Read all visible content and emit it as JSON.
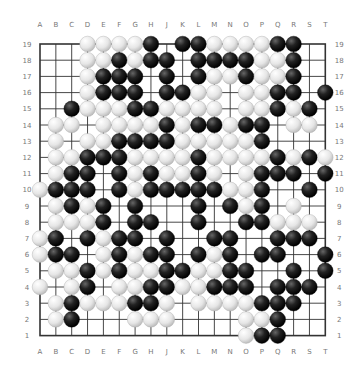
{
  "board": {
    "size": 19,
    "columns": [
      "A",
      "B",
      "C",
      "D",
      "E",
      "F",
      "G",
      "H",
      "J",
      "K",
      "L",
      "M",
      "N",
      "O",
      "P",
      "Q",
      "R",
      "S",
      "T"
    ],
    "rows": [
      "19",
      "18",
      "17",
      "16",
      "15",
      "14",
      "13",
      "12",
      "11",
      "10",
      "9",
      "8",
      "7",
      "6",
      "5",
      "4",
      "3",
      "2",
      "1"
    ],
    "colors": {
      "background": "#ffffff",
      "grid": "#333333",
      "black": "#1a1a1a",
      "white": "#f2f2f2",
      "label": "#777777"
    },
    "stones": {
      "19": {
        "D": "W",
        "E": "W",
        "F": "W",
        "G": "W",
        "H": "B",
        "K": "B",
        "L": "B",
        "M": "W",
        "N": "W",
        "O": "W",
        "P": "W",
        "Q": "B",
        "R": "B"
      },
      "18": {
        "D": "W",
        "E": "W",
        "F": "B",
        "G": "W",
        "H": "B",
        "J": "B",
        "L": "B",
        "M": "B",
        "N": "B",
        "O": "B",
        "P": "W",
        "Q": "W",
        "R": "B"
      },
      "17": {
        "D": "W",
        "E": "B",
        "F": "B",
        "G": "B",
        "J": "B",
        "L": "B",
        "M": "W",
        "N": "W",
        "O": "B",
        "P": "W",
        "Q": "W",
        "R": "B"
      },
      "16": {
        "D": "W",
        "E": "B",
        "F": "B",
        "G": "B",
        "J": "B",
        "K": "B",
        "L": "W",
        "M": "W",
        "O": "W",
        "P": "W",
        "Q": "B",
        "R": "B",
        "T": "B"
      },
      "15": {
        "C": "B",
        "D": "W",
        "E": "W",
        "F": "W",
        "G": "B",
        "H": "B",
        "J": "W",
        "K": "W",
        "L": "W",
        "M": "W",
        "O": "W",
        "P": "W",
        "Q": "B",
        "R": "W",
        "S": "B"
      },
      "14": {
        "B": "W",
        "C": "W",
        "E": "W",
        "F": "W",
        "G": "W",
        "H": "W",
        "J": "B",
        "K": "W",
        "L": "B",
        "M": "B",
        "N": "W",
        "O": "B",
        "P": "B",
        "R": "W",
        "S": "W"
      },
      "13": {
        "B": "W",
        "D": "W",
        "E": "W",
        "F": "B",
        "G": "B",
        "H": "B",
        "J": "B",
        "K": "W",
        "L": "W",
        "M": "W",
        "N": "W",
        "O": "W",
        "P": "B"
      },
      "12": {
        "B": "W",
        "C": "W",
        "D": "B",
        "E": "B",
        "F": "B",
        "G": "W",
        "H": "W",
        "J": "W",
        "K": "W",
        "L": "B",
        "M": "W",
        "N": "W",
        "O": "W",
        "P": "W",
        "Q": "B",
        "R": "W",
        "S": "B",
        "T": "W"
      },
      "11": {
        "B": "W",
        "C": "B",
        "D": "B",
        "F": "B",
        "G": "W",
        "H": "B",
        "J": "W",
        "K": "W",
        "L": "B",
        "M": "W",
        "O": "W",
        "P": "B",
        "Q": "B",
        "R": "B",
        "T": "B"
      },
      "10": {
        "A": "W",
        "B": "B",
        "C": "B",
        "D": "B",
        "F": "B",
        "G": "W",
        "H": "B",
        "J": "B",
        "K": "B",
        "L": "B",
        "M": "B",
        "N": "W",
        "O": "W",
        "P": "B",
        "S": "B"
      },
      "9": {
        "B": "W",
        "C": "B",
        "D": "W",
        "E": "B",
        "G": "B",
        "L": "B",
        "N": "B",
        "O": "W",
        "P": "B",
        "R": "W"
      },
      "8": {
        "B": "W",
        "C": "W",
        "D": "W",
        "E": "B",
        "G": "B",
        "H": "B",
        "L": "B",
        "O": "B",
        "P": "B",
        "Q": "W",
        "R": "W",
        "S": "W"
      },
      "7": {
        "A": "W",
        "B": "B",
        "D": "B",
        "E": "W",
        "F": "B",
        "G": "B",
        "J": "B",
        "M": "B",
        "N": "B",
        "Q": "B",
        "R": "B",
        "S": "B"
      },
      "6": {
        "A": "W",
        "B": "B",
        "C": "B",
        "E": "W",
        "F": "B",
        "G": "W",
        "H": "B",
        "J": "B",
        "L": "B",
        "M": "W",
        "N": "B",
        "P": "B",
        "Q": "B",
        "T": "B"
      },
      "5": {
        "B": "W",
        "C": "W",
        "D": "B",
        "E": "W",
        "F": "B",
        "G": "W",
        "H": "W",
        "J": "B",
        "K": "B",
        "L": "W",
        "M": "W",
        "N": "B",
        "O": "B",
        "R": "B",
        "T": "B"
      },
      "4": {
        "A": "W",
        "C": "W",
        "D": "B",
        "F": "W",
        "G": "W",
        "H": "B",
        "J": "B",
        "K": "W",
        "L": "W",
        "M": "B",
        "N": "B",
        "O": "B",
        "Q": "B",
        "R": "B",
        "S": "B"
      },
      "3": {
        "B": "W",
        "C": "B",
        "D": "W",
        "E": "W",
        "F": "W",
        "G": "B",
        "H": "B",
        "J": "W",
        "L": "W",
        "M": "W",
        "N": "W",
        "O": "W",
        "P": "B",
        "Q": "B",
        "R": "B"
      },
      "2": {
        "B": "W",
        "C": "B",
        "G": "W",
        "H": "W",
        "J": "W",
        "O": "W",
        "P": "W",
        "Q": "B"
      },
      "1": {
        "O": "W",
        "P": "B",
        "Q": "B"
      }
    }
  }
}
